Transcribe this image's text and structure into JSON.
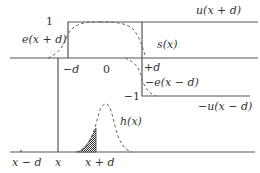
{
  "diagram": {
    "upper_plot": {
      "curves": {
        "u_plus": "u(x + d)",
        "u_minus": "−u(x − d)",
        "e_plus": "e(x + d)",
        "e_minus": "−e(x − d)",
        "s": "s(x)"
      },
      "ticks": {
        "minus_d": "−d",
        "zero": "0",
        "plus_d": "+d"
      },
      "levels": {
        "one": "1",
        "minus_one": "−1"
      }
    },
    "lower_plot": {
      "curves": {
        "h": "h(x)"
      },
      "ticks": {
        "x_minus_d": "x − d",
        "x": "x",
        "x_plus_d": "x + d"
      },
      "shaded_region": "area under h(x) left of x + d"
    }
  }
}
